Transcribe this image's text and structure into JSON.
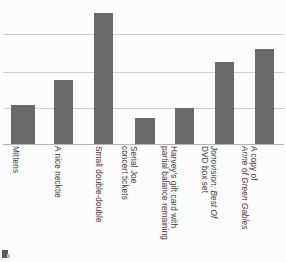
{
  "chart_data": {
    "type": "bar",
    "title": "",
    "subtitle": "",
    "xlabel": "",
    "ylabel": "",
    "categories": [
      "Mittens",
      "A nice necktie",
      "Small double-double",
      "Serial Joe concert tickets",
      "Harvey's gift card with partial balance remaining",
      "Jonovision: Best Of DVD box set",
      "A copy of Anne of Green Gables"
    ],
    "category_lines": [
      [
        "Mittens"
      ],
      [
        "A nice necktie"
      ],
      [
        "Small double-double"
      ],
      [
        "Serial Joe",
        "concert tickets"
      ],
      [
        "Harvey's gift card with",
        "partial balance remaining"
      ],
      [
        "Jonovision: Best Of",
        "DVD box set"
      ],
      [
        "A copy of",
        "Anne of Green Gables"
      ]
    ],
    "values": [
      1.06,
      1.73,
      3.54,
      0.7,
      1.0,
      2.22,
      2.57
    ],
    "ylim": [
      0,
      4
    ],
    "yticks": [
      1,
      2,
      3
    ],
    "grid": true,
    "legend": "none",
    "bar_color": "#6a6a6a",
    "gridline_color": "#cfcfcf",
    "axis_color": "#b4b4b4",
    "background_color": "#fcfcfc"
  },
  "bars": [
    {
      "label": "Mittens",
      "value": 1.06,
      "left_px": 11,
      "width_px": 24,
      "top_px": 105
    },
    {
      "label": "A nice necktie",
      "value": 1.73,
      "left_px": 54,
      "width_px": 19,
      "top_px": 80
    },
    {
      "label": "Small double-double",
      "value": 3.54,
      "left_px": 94,
      "width_px": 19,
      "top_px": 13
    },
    {
      "label": "Serial Joe concert tickets",
      "value": 0.7,
      "left_px": 135,
      "width_px": 20,
      "top_px": 118
    },
    {
      "label": "Harvey's gift card with partial balance remaining",
      "value": 1.0,
      "left_px": 175,
      "width_px": 19,
      "top_px": 108
    },
    {
      "label": "Jonovision: Best Of DVD box set",
      "value": 2.22,
      "left_px": 215,
      "width_px": 19,
      "top_px": 62
    },
    {
      "label": "A copy of Anne of Green Gables",
      "value": 2.57,
      "left_px": 255,
      "width_px": 19,
      "top_px": 49
    }
  ],
  "gridlines": [
    {
      "value": 3,
      "top_px": 34
    },
    {
      "value": 2,
      "top_px": 72
    },
    {
      "value": 1,
      "top_px": 108
    }
  ],
  "tick_labels": [
    {
      "left_px": 20,
      "lines": [
        {
          "text": "Mittens",
          "italic": false
        }
      ]
    },
    {
      "left_px": 62,
      "lines": [
        {
          "text": "A nice necktie",
          "italic": false
        }
      ]
    },
    {
      "left_px": 103,
      "lines": [
        {
          "text": "Small double-double",
          "italic": false
        }
      ]
    },
    {
      "left_px": 138,
      "lines": [
        {
          "text": "Serial Joe",
          "italic": false
        },
        {
          "text": "concert tickets",
          "italic": false
        }
      ]
    },
    {
      "left_px": 178,
      "lines": [
        {
          "text": "Harvey's gift card with",
          "italic": false
        },
        {
          "text": "partial balance remaining",
          "italic": false
        }
      ]
    },
    {
      "left_px": 218,
      "lines": [
        {
          "text": "Jonovision: Best Of",
          "italic": true
        },
        {
          "text": "DVD box set",
          "italic": false
        }
      ]
    },
    {
      "left_px": 258,
      "lines": [
        {
          "text": "A copy of",
          "italic": false
        },
        {
          "text": "Anne of Green Gables",
          "italic": true
        }
      ]
    }
  ]
}
